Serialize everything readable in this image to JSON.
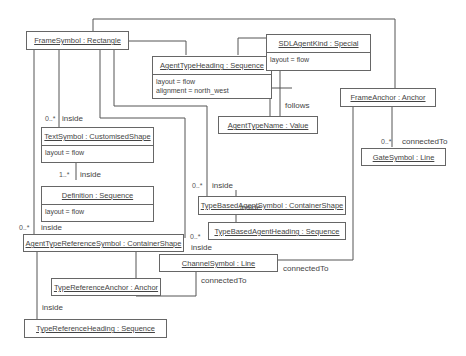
{
  "boxes": {
    "frame_symbol": {
      "title": "FrameSymbol : Rectangle"
    },
    "agent_type_heading": {
      "title": "AgentTypeHeading : Sequence",
      "attrs": [
        "layout = flow",
        "alignment = north_west"
      ]
    },
    "sdl_agent_kind": {
      "title": "SDLAgentKind : Special",
      "attrs": [
        "layout = flow"
      ]
    },
    "agent_type_name": {
      "title": "AgentTypeName : Value"
    },
    "frame_anchor": {
      "title": "FrameAnchor : Anchor"
    },
    "gate_symbol": {
      "title": "GateSymbol : Line"
    },
    "text_symbol": {
      "title": "TextSymbol : CustomisedShape",
      "attrs": [
        "layout = flow"
      ]
    },
    "definition": {
      "title": "Definition : Sequence",
      "attrs": [
        "layout = flow"
      ]
    },
    "type_based_agent_symbol": {
      "title": "TypeBasedAgentSymbol : ContainerShape"
    },
    "type_based_agent_heading": {
      "title": "TypeBasedAgentHeading : Sequence"
    },
    "agent_type_reference_symbol": {
      "title": "AgentTypeReferenceSymbol : ContainerShape"
    },
    "channel_symbol": {
      "title": "ChannelSymbol : Line"
    },
    "type_reference_anchor": {
      "title": "TypeReferenceAnchor : Anchor"
    },
    "type_reference_heading": {
      "title": "TypeReferenceHeading : Sequence"
    }
  },
  "labels": {
    "inside": "inside",
    "follows": "follows",
    "connected_to": "connectedTo",
    "mult_0_many": "0..*",
    "mult_1_many": "1..*"
  }
}
